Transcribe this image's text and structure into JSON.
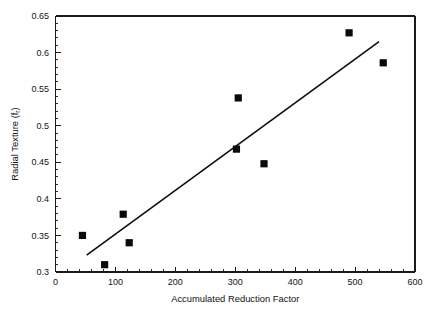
{
  "chart_data": {
    "type": "scatter",
    "title": "",
    "xlabel": "Accumulated Reduction Factor",
    "ylabel": "Radial Texture (f",
    "ylabel_sub": "r",
    "ylabel_close": ")",
    "xlim": [
      0,
      600
    ],
    "ylim": [
      0.3,
      0.65
    ],
    "xticks": [
      0,
      100,
      200,
      300,
      400,
      500,
      600
    ],
    "xtick_labels": [
      "0",
      "100",
      "200",
      "300",
      "400",
      "500",
      "600"
    ],
    "yticks": [
      0.3,
      0.35,
      0.4,
      0.45,
      0.5,
      0.55,
      0.6,
      0.65
    ],
    "ytick_labels": [
      "0.3",
      "0.35",
      "0.4",
      "0.45",
      "0.5",
      "0.55",
      "0.6",
      "0.65"
    ],
    "x_minor_step": 20,
    "y_minor_step": 0.01,
    "grid": false,
    "legend": false,
    "marker": "filled-square",
    "marker_color": "#0a0a0a",
    "line_color": "#0d0d0d",
    "points": [
      {
        "x": 45,
        "y": 0.35
      },
      {
        "x": 82,
        "y": 0.31
      },
      {
        "x": 113,
        "y": 0.379
      },
      {
        "x": 123,
        "y": 0.34
      },
      {
        "x": 302,
        "y": 0.468
      },
      {
        "x": 305,
        "y": 0.538
      },
      {
        "x": 348,
        "y": 0.448
      },
      {
        "x": 490,
        "y": 0.627
      },
      {
        "x": 547,
        "y": 0.586
      }
    ],
    "trend_line": {
      "x": [
        52,
        540
      ],
      "y": [
        0.323,
        0.615
      ]
    }
  }
}
